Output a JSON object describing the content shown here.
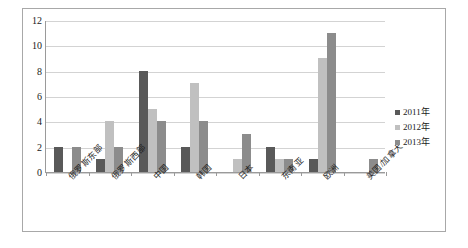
{
  "chart_data": {
    "type": "bar",
    "title": "",
    "subtitle": "",
    "xlabel": "",
    "ylabel": "",
    "ylim": [
      0,
      12
    ],
    "ytick_step": 2,
    "ytick_labels": [
      "0",
      "2",
      "4",
      "6",
      "8",
      "10",
      "12"
    ],
    "grid": true,
    "legend_position": "right",
    "categories": [
      "俄罗斯东部",
      "俄罗斯西部",
      "中国",
      "韩国",
      "日本",
      "东南亚",
      "欧洲",
      "美国/加拿大"
    ],
    "series": [
      {
        "name": "2011年",
        "color": "#595959",
        "values": [
          2,
          1,
          8,
          2,
          0,
          2,
          1,
          0
        ]
      },
      {
        "name": "2012年",
        "color": "#c0c0c0",
        "values": [
          0,
          4,
          5,
          7,
          1,
          1,
          9,
          0
        ]
      },
      {
        "name": "2013年",
        "color": "#8c8c8c",
        "values": [
          2,
          2,
          4,
          4,
          3,
          1,
          11,
          1
        ]
      }
    ]
  },
  "legend": {
    "items": [
      {
        "label": "2011年",
        "swatch": "legend-swatch-2011"
      },
      {
        "label": "2012年",
        "swatch": "legend-swatch-2012"
      },
      {
        "label": "2013年",
        "swatch": "legend-swatch-2013"
      }
    ]
  }
}
